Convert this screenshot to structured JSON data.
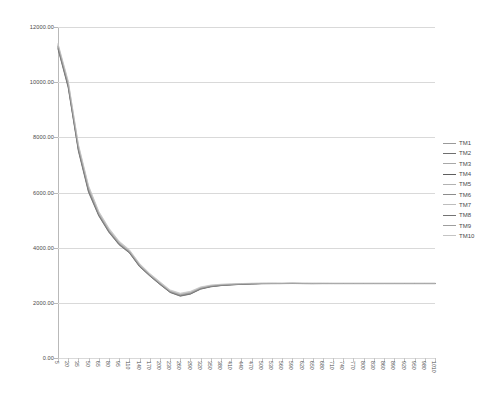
{
  "chart_data": {
    "type": "line",
    "title": "",
    "xlabel": "",
    "ylabel": "",
    "grid": true,
    "legend_position": "right",
    "ylim": [
      0,
      12000
    ],
    "ytick_labels": [
      "0.00",
      "2000.00",
      "4000.00",
      "6000.00",
      "8000.00",
      "10000.00",
      "12000.00"
    ],
    "ytick_values": [
      0,
      2000,
      4000,
      6000,
      8000,
      10000,
      12000
    ],
    "categories": [
      "5",
      "20",
      "35",
      "50",
      "65",
      "80",
      "95",
      "110",
      "140",
      "170",
      "200",
      "230",
      "260",
      "290",
      "320",
      "350",
      "380",
      "410",
      "440",
      "470",
      "500",
      "530",
      "560",
      "590",
      "620",
      "650",
      "680",
      "710",
      "740",
      "770",
      "800",
      "830",
      "860",
      "890",
      "920",
      "950",
      "980",
      "1010"
    ],
    "series": [
      {
        "name": "TM1",
        "color": "#9a9a9a",
        "values": [
          11300,
          9900,
          7600,
          6100,
          5200,
          4600,
          4150,
          3850,
          3350,
          3000,
          2700,
          2400,
          2280,
          2350,
          2520,
          2600,
          2640,
          2660,
          2680,
          2690,
          2700,
          2700,
          2700,
          2705,
          2700,
          2700,
          2700,
          2700,
          2700,
          2700,
          2700,
          2700,
          2700,
          2700,
          2700,
          2700,
          2700,
          2700
        ]
      },
      {
        "name": "TM2",
        "color": "#6f6f6f",
        "values": [
          11250,
          9850,
          7550,
          6050,
          5180,
          4580,
          4120,
          3830,
          3330,
          2990,
          2680,
          2390,
          2260,
          2330,
          2510,
          2590,
          2630,
          2655,
          2675,
          2688,
          2698,
          2700,
          2700,
          2702,
          2700,
          2698,
          2700,
          2700,
          2700,
          2700,
          2700,
          2700,
          2700,
          2700,
          2700,
          2700,
          2700,
          2700
        ]
      },
      {
        "name": "TM3",
        "color": "#a8a8a8",
        "values": [
          11320,
          9950,
          7650,
          6150,
          5250,
          4640,
          4180,
          3880,
          3380,
          3020,
          2720,
          2420,
          2300,
          2370,
          2540,
          2615,
          2650,
          2668,
          2685,
          2695,
          2702,
          2703,
          2702,
          2708,
          2703,
          2702,
          2702,
          2701,
          2701,
          2701,
          2701,
          2701,
          2701,
          2701,
          2701,
          2701,
          2701,
          2701
        ]
      },
      {
        "name": "TM4",
        "color": "#5e5e5e",
        "values": [
          11200,
          9800,
          7500,
          6000,
          5150,
          4550,
          4100,
          3810,
          3310,
          2975,
          2665,
          2375,
          2240,
          2315,
          2495,
          2580,
          2625,
          2650,
          2670,
          2685,
          2695,
          2697,
          2698,
          2700,
          2698,
          2697,
          2698,
          2698,
          2698,
          2698,
          2698,
          2698,
          2698,
          2698,
          2698,
          2698,
          2698,
          2698
        ]
      },
      {
        "name": "TM5",
        "color": "#b2b2b2",
        "values": [
          11350,
          10000,
          7700,
          6200,
          5280,
          4670,
          4200,
          3900,
          3400,
          3040,
          2740,
          2440,
          2320,
          2390,
          2555,
          2625,
          2660,
          2675,
          2690,
          2700,
          2706,
          2707,
          2706,
          2710,
          2706,
          2705,
          2705,
          2704,
          2704,
          2704,
          2704,
          2704,
          2704,
          2704,
          2704,
          2704,
          2704,
          2704
        ]
      },
      {
        "name": "TM6",
        "color": "#8c8c8c",
        "values": [
          11280,
          9880,
          7580,
          6080,
          5200,
          4600,
          4140,
          3845,
          3345,
          2998,
          2690,
          2400,
          2270,
          2345,
          2515,
          2598,
          2638,
          2662,
          2682,
          2692,
          2701,
          2702,
          2701,
          2704,
          2701,
          2700,
          2701,
          2700,
          2700,
          2700,
          2700,
          2700,
          2700,
          2700,
          2700,
          2700,
          2700,
          2700
        ]
      },
      {
        "name": "TM7",
        "color": "#bdbdbd",
        "values": [
          11380,
          10020,
          7720,
          6220,
          5300,
          4690,
          4220,
          3915,
          3415,
          3055,
          2755,
          2455,
          2335,
          2405,
          2565,
          2635,
          2668,
          2682,
          2695,
          2705,
          2710,
          2711,
          2710,
          2714,
          2710,
          2709,
          2709,
          2708,
          2708,
          2708,
          2708,
          2708,
          2708,
          2708,
          2708,
          2708,
          2708,
          2708
        ]
      },
      {
        "name": "TM8",
        "color": "#737373",
        "values": [
          11230,
          9830,
          7530,
          6030,
          5165,
          4565,
          4110,
          3820,
          3320,
          2982,
          2672,
          2382,
          2250,
          2322,
          2502,
          2585,
          2628,
          2652,
          2672,
          2687,
          2696,
          2698,
          2699,
          2701,
          2699,
          2698,
          2699,
          2699,
          2699,
          2699,
          2699,
          2699,
          2699,
          2699,
          2699,
          2699,
          2699,
          2699
        ]
      },
      {
        "name": "TM9",
        "color": "#9e9e9e",
        "values": [
          11310,
          9920,
          7620,
          6120,
          5220,
          4615,
          4160,
          3860,
          3360,
          3008,
          2705,
          2408,
          2288,
          2358,
          2528,
          2606,
          2644,
          2664,
          2684,
          2693,
          2702,
          2703,
          2702,
          2706,
          2702,
          2701,
          2702,
          2701,
          2701,
          2701,
          2701,
          2701,
          2701,
          2701,
          2701,
          2701,
          2701,
          2701
        ]
      },
      {
        "name": "TM10",
        "color": "#c4c4c4",
        "values": [
          11400,
          10050,
          7750,
          6250,
          5320,
          4710,
          4240,
          3930,
          3430,
          3070,
          2770,
          2470,
          2350,
          2420,
          2578,
          2645,
          2675,
          2688,
          2700,
          2710,
          2714,
          2715,
          2714,
          2718,
          2714,
          2713,
          2713,
          2712,
          2712,
          2712,
          2712,
          2712,
          2712,
          2712,
          2712,
          2712,
          2712,
          2712
        ]
      }
    ]
  },
  "legend": {
    "items": [
      {
        "label": "TM1"
      },
      {
        "label": "TM2"
      },
      {
        "label": "TM3"
      },
      {
        "label": "TM4"
      },
      {
        "label": "TM5"
      },
      {
        "label": "TM6"
      },
      {
        "label": "TM7"
      },
      {
        "label": "TM8"
      },
      {
        "label": "TM9"
      },
      {
        "label": "TM10"
      }
    ]
  },
  "colors": {
    "gridline": "#d9d9d9",
    "axis": "#b9b9b9",
    "tick_text": "#4a4a4a",
    "background": "#ffffff"
  }
}
